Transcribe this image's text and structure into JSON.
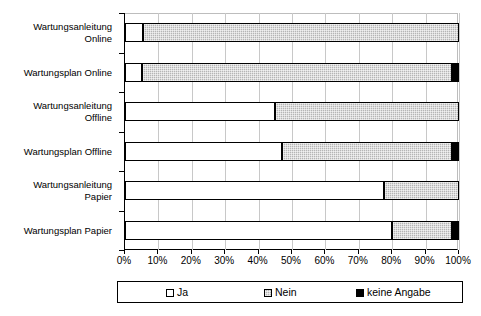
{
  "chart_data": {
    "type": "bar",
    "orientation": "horizontal",
    "stacked": true,
    "stack_mode": "percent",
    "title": "",
    "subtitle": "",
    "xlabel": "",
    "ylabel": "",
    "xlim": [
      0,
      100
    ],
    "xticks": [
      0,
      10,
      20,
      30,
      40,
      50,
      60,
      70,
      80,
      90,
      100
    ],
    "xtick_labels": [
      "0%",
      "10%",
      "20%",
      "30%",
      "40%",
      "50%",
      "60%",
      "70%",
      "80%",
      "90%",
      "100%"
    ],
    "grid": true,
    "grid_axis": "x",
    "legend_position": "bottom",
    "categories": [
      "Wartungsanleitung\nOnline",
      "Wartungsplan Online",
      "Wartungsanleitung\nOffline",
      "Wartungsplan Offline",
      "Wartungsanleitung\nPapier",
      "Wartungsplan Papier"
    ],
    "series": [
      {
        "name": "Ja",
        "color": "#ffffff",
        "pattern": "solid-white",
        "values": [
          5.4,
          5.1,
          45.0,
          47.0,
          77.5,
          80.0
        ]
      },
      {
        "name": "Nein",
        "color": "#b5b5b5",
        "pattern": "dotted-grey",
        "values": [
          94.6,
          92.9,
          55.0,
          51.0,
          22.5,
          18.0
        ]
      },
      {
        "name": "keine Angabe",
        "color": "#000000",
        "pattern": "solid-black",
        "values": [
          0.0,
          2.0,
          0.0,
          2.0,
          0.0,
          2.0
        ]
      }
    ]
  },
  "legend": {
    "items": [
      {
        "label": "Ja",
        "swatch": "legend-swatch-ja"
      },
      {
        "label": "Nein",
        "swatch": "legend-swatch-nein"
      },
      {
        "label": "keine Angabe",
        "swatch": "legend-swatch-keine-angabe"
      }
    ]
  }
}
